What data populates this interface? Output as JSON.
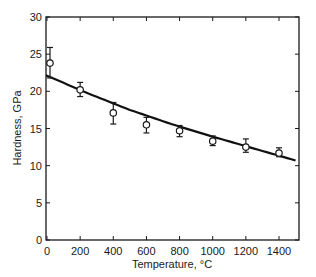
{
  "chart_data": {
    "type": "scatter",
    "title": "",
    "xlabel": "Temperature, °C",
    "ylabel": "Hardness, GPa",
    "xlim": [
      0,
      1500
    ],
    "ylim": [
      0,
      30
    ],
    "xticks": [
      0,
      200,
      400,
      600,
      800,
      1000,
      1200,
      1400
    ],
    "yticks": [
      0,
      5,
      10,
      15,
      20,
      25,
      30
    ],
    "grid": false,
    "legend": null,
    "series": [
      {
        "name": "measured",
        "marker": "open-circle",
        "x": [
          0,
          200,
          400,
          600,
          800,
          1000,
          1200,
          1400
        ],
        "y": [
          23.8,
          20.2,
          17.1,
          15.5,
          14.7,
          13.3,
          12.5,
          11.7
        ],
        "err_low": [
          21.8,
          19.3,
          15.6,
          14.4,
          13.9,
          12.7,
          11.8,
          11.2
        ],
        "err_high": [
          25.9,
          21.2,
          18.5,
          16.5,
          15.4,
          14.0,
          13.6,
          12.4
        ]
      },
      {
        "name": "fit",
        "style": "line",
        "x": [
          0,
          250,
          500,
          750,
          1000,
          1250,
          1500
        ],
        "y": [
          22.1,
          19.7,
          17.5,
          15.6,
          13.9,
          12.3,
          10.7
        ]
      }
    ],
    "colors": {
      "axis": "#1a1a1a",
      "line": "#111111",
      "marker_fill": "#ffffff"
    }
  }
}
